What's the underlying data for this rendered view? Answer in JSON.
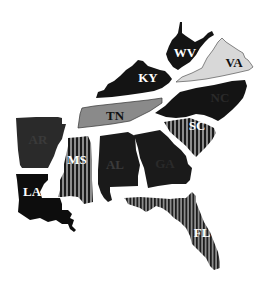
{
  "map": {
    "region": "Southeastern United States",
    "fills": {
      "solid": "#141414",
      "light": "#d8d8d8",
      "medium": "#8a8a8a",
      "stripe_dark": "#1a1a1a",
      "stripe_light": "#8c8c8c"
    },
    "states": [
      {
        "abbr": "WV",
        "fill": "solid",
        "label_color": "#ffffff"
      },
      {
        "abbr": "VA",
        "fill": "light",
        "label_color": "#111111"
      },
      {
        "abbr": "KY",
        "fill": "solid",
        "label_color": "#ffffff"
      },
      {
        "abbr": "TN",
        "fill": "medium",
        "label_color": "#111111"
      },
      {
        "abbr": "NC",
        "fill": "solid",
        "label_color": "#2a2a2a"
      },
      {
        "abbr": "SC",
        "fill": "striped",
        "label_color": "#ffffff"
      },
      {
        "abbr": "AR",
        "fill": "solid",
        "label_color": "#3a3a3a"
      },
      {
        "abbr": "MS",
        "fill": "striped",
        "label_color": "#ffffff"
      },
      {
        "abbr": "AL",
        "fill": "solid",
        "label_color": "#3a3a3a"
      },
      {
        "abbr": "GA",
        "fill": "solid",
        "label_color": "#2a2a2a"
      },
      {
        "abbr": "LA",
        "fill": "solid",
        "label_color": "#ffffff"
      },
      {
        "abbr": "FL",
        "fill": "striped",
        "label_color": "#ffffff"
      }
    ]
  }
}
